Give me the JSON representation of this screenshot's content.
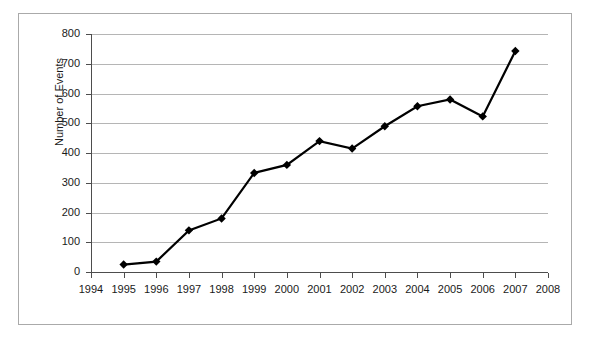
{
  "chart_data": {
    "type": "line",
    "title": "",
    "subtitle": "",
    "xlabel": "",
    "ylabel": "Number of Events",
    "x": [
      1995,
      1996,
      1997,
      1998,
      1999,
      2000,
      2001,
      2002,
      2003,
      2004,
      2005,
      2006,
      2007
    ],
    "values": [
      25,
      35,
      140,
      180,
      333,
      360,
      440,
      415,
      490,
      557,
      580,
      523,
      743
    ],
    "series": [
      {
        "name": "Number of Events",
        "values": [
          25,
          35,
          140,
          180,
          333,
          360,
          440,
          415,
          490,
          557,
          580,
          523,
          743
        ],
        "color": "#000000",
        "marker": "diamond",
        "line_width": 2
      }
    ],
    "xlim": [
      1994,
      2008
    ],
    "ylim": [
      0,
      800
    ],
    "x_tick_labels": [
      "1994",
      "1995",
      "1996",
      "1997",
      "1998",
      "1999",
      "2000",
      "2001",
      "2002",
      "2003",
      "2004",
      "2005",
      "2006",
      "2007",
      "2008"
    ],
    "x_ticks": [
      1994,
      1995,
      1996,
      1997,
      1998,
      1999,
      2000,
      2001,
      2002,
      2003,
      2004,
      2005,
      2006,
      2007,
      2008
    ],
    "y_tick_labels": [
      "0",
      "100",
      "200",
      "300",
      "400",
      "500",
      "600",
      "700",
      "800"
    ],
    "y_ticks": [
      0,
      100,
      200,
      300,
      400,
      500,
      600,
      700,
      800
    ],
    "grid": "horizontal",
    "grid_color": "#b5b5b5",
    "legend": "none",
    "frame_color": "#aaaaaa",
    "axis_color": "#4d4d4d",
    "background": "#ffffff"
  }
}
